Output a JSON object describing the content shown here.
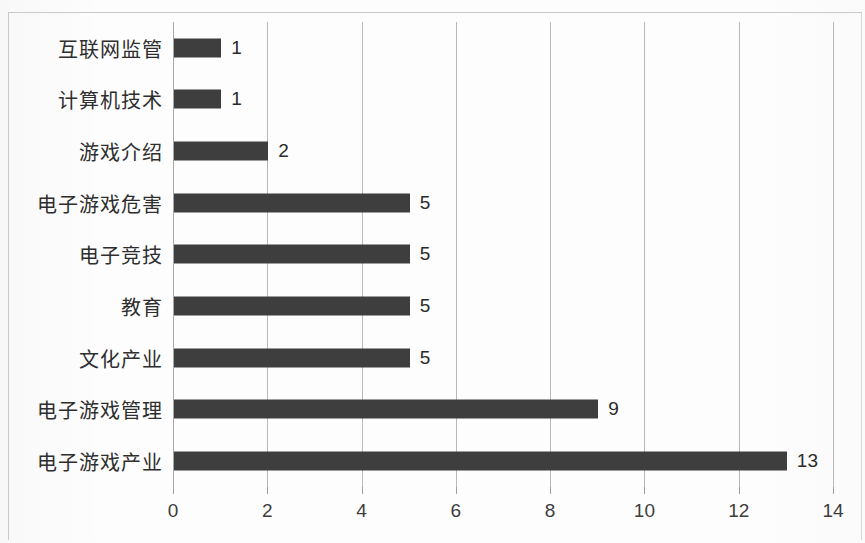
{
  "chart_data": {
    "type": "bar",
    "orientation": "horizontal",
    "title": "",
    "subtitle": "",
    "xlabel": "",
    "ylabel": "",
    "xlim": [
      0,
      14
    ],
    "grid": true,
    "legend": false,
    "legend_position": "none",
    "bar_color": "#3e3e3e",
    "categories": [
      "互联网监管",
      "计算机技术",
      "游戏介绍",
      "电子游戏危害",
      "电子竞技",
      "教育",
      "文化产业",
      "电子游戏管理",
      "电子游戏产业"
    ],
    "values": [
      1,
      1,
      2,
      5,
      5,
      5,
      5,
      9,
      13
    ],
    "data_labels": [
      "1",
      "1",
      "2",
      "5",
      "5",
      "5",
      "5",
      "9",
      "13"
    ],
    "xticks": [
      0,
      2,
      4,
      6,
      8,
      10,
      12,
      14
    ],
    "xtick_labels": [
      "0",
      "2",
      "4",
      "6",
      "8",
      "10",
      "12",
      "14"
    ]
  }
}
